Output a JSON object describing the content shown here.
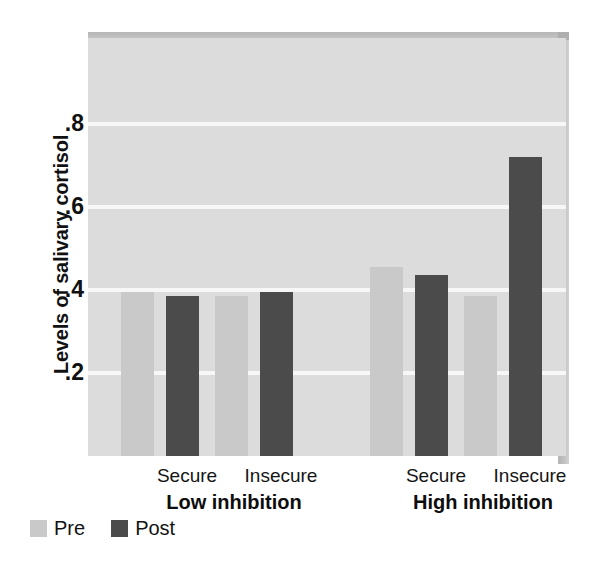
{
  "chart_data": {
    "type": "bar",
    "title": "",
    "xlabel": "",
    "ylabel": "Levels of salivary cortisol",
    "ylim": [
      0,
      1.0
    ],
    "ytick_labels": [
      ".2",
      ".4",
      ".6",
      ".8"
    ],
    "ytick_values": [
      0.2,
      0.4,
      0.6,
      0.8
    ],
    "grid": true,
    "legend_position": "below-left",
    "categories": [
      "Secure",
      "Insecure",
      "Secure",
      "Insecure"
    ],
    "groups": [
      {
        "label": "Low inhibition",
        "categories": [
          "Secure",
          "Insecure"
        ]
      },
      {
        "label": "High inhibition",
        "categories": [
          "Secure",
          "Insecure"
        ]
      }
    ],
    "series": [
      {
        "name": "Pre",
        "color": "#c9c9c9",
        "values": [
          0.395,
          0.385,
          0.455,
          0.385
        ]
      },
      {
        "name": "Post",
        "color": "#4b4b4b",
        "values": [
          0.385,
          0.395,
          0.435,
          0.72
        ]
      }
    ],
    "bars": [
      {
        "group": "Low inhibition",
        "category": "Secure",
        "series": "Pre",
        "value": 0.395
      },
      {
        "group": "Low inhibition",
        "category": "Secure",
        "series": "Post",
        "value": 0.385
      },
      {
        "group": "Low inhibition",
        "category": "Insecure",
        "series": "Pre",
        "value": 0.385
      },
      {
        "group": "Low inhibition",
        "category": "Insecure",
        "series": "Post",
        "value": 0.395
      },
      {
        "group": "High inhibition",
        "category": "Secure",
        "series": "Pre",
        "value": 0.455
      },
      {
        "group": "High inhibition",
        "category": "Secure",
        "series": "Post",
        "value": 0.435
      },
      {
        "group": "High inhibition",
        "category": "Insecure",
        "series": "Pre",
        "value": 0.385
      },
      {
        "group": "High inhibition",
        "category": "Insecure",
        "series": "Post",
        "value": 0.72
      }
    ],
    "legend": [
      {
        "label": "Pre",
        "color": "#c9c9c9"
      },
      {
        "label": "Post",
        "color": "#4b4b4b"
      }
    ]
  },
  "colors": {
    "plot_background": "#dcdcdc",
    "gridline": "#f7f7f7",
    "panel_shadow": "#b7b7b7",
    "pre_bar": "#c9c9c9",
    "post_bar": "#4b4b4b",
    "text": "#111111",
    "page_background": "#ffffff"
  }
}
